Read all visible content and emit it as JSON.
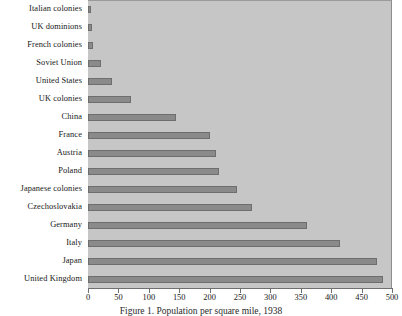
{
  "chart_data": {
    "type": "bar",
    "orientation": "horizontal",
    "title": "",
    "caption": "Figure 1.  Population per square mile, 1938",
    "xlabel": "",
    "ylabel": "",
    "xlim": [
      0,
      500
    ],
    "xticks": [
      0,
      50,
      100,
      150,
      200,
      250,
      300,
      350,
      400,
      450,
      500
    ],
    "grid": false,
    "legend": false,
    "categories": [
      "Italian colonies",
      "UK dominions",
      "French colonies",
      "Soviet Union",
      "United States",
      "UK colonies",
      "China",
      "France",
      "Austria",
      "Poland",
      "Japanese colonies",
      "Czechoslovakia",
      "Germany",
      "Italy",
      "Japan",
      "United Kingdom"
    ],
    "values": [
      5,
      6,
      8,
      22,
      40,
      70,
      145,
      200,
      210,
      215,
      245,
      270,
      360,
      415,
      475,
      485
    ],
    "bar_color": "#8a8a8a",
    "bar_edge_color": "#6e6e6e",
    "plot_background": "#c6c6c6",
    "page_background": "#ffffff",
    "text_color": "#171717"
  }
}
